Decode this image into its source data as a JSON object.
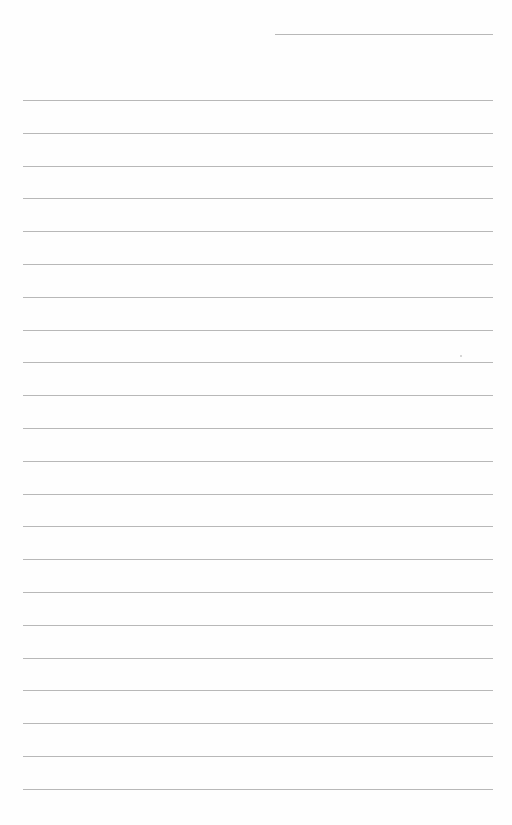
{
  "page": {
    "type": "blank ruled notebook page",
    "background_color": "#fefefe",
    "line_color": "#b8b8b8",
    "header_line": {
      "x1": 275,
      "x2": 493,
      "y": 34
    },
    "rules": {
      "count": 22,
      "x1": 23,
      "x2": 493,
      "first_y": 100,
      "spacing": 32.8
    },
    "content_text": ""
  }
}
